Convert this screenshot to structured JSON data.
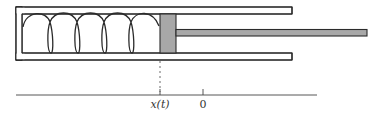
{
  "diagram": {
    "colors": {
      "stroke": "#2b2b2b",
      "piston_fill": "#a8a8a8",
      "rod_fill": "#a8a8a8",
      "background": "#ffffff"
    },
    "cylinder": {
      "x": 16,
      "y": 7,
      "right": 292,
      "bottom": 60,
      "wall": 6,
      "left_wall": 6
    },
    "piston": {
      "x": 160,
      "width": 16
    },
    "rod": {
      "y": 29,
      "height": 7,
      "right": 367
    },
    "spring": {
      "coils": 5,
      "start_x": 23,
      "end_x": 159
    },
    "axis": {
      "y": 95,
      "x_start": 16,
      "x_end": 317,
      "ticks": [
        {
          "x": 160,
          "label": "x(t)",
          "italic": true
        },
        {
          "x": 203,
          "label": "0",
          "italic": false
        }
      ]
    },
    "labels": {
      "position": "x(t)",
      "origin": "0"
    }
  }
}
